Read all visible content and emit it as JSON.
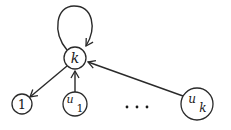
{
  "diagram": {
    "type": "directed-graph",
    "nodes": {
      "k": {
        "label": "k",
        "cx": 75,
        "cy": 58,
        "r": 11
      },
      "one": {
        "label": "1",
        "cx": 22,
        "cy": 104,
        "r": 10
      },
      "u1": {
        "label_main": "u",
        "label_sub": "1",
        "cx": 75,
        "cy": 104,
        "r": 12
      },
      "uk": {
        "label_main": "u",
        "label_sub": "k",
        "cx": 197,
        "cy": 104,
        "r": 16
      }
    },
    "ellipsis": "· · ·",
    "edges": [
      {
        "from": "k",
        "to": "k",
        "kind": "self-loop"
      },
      {
        "from": "k",
        "to": "1"
      },
      {
        "from": "u1",
        "to": "k"
      },
      {
        "from": "uk",
        "to": "k"
      }
    ],
    "colors": {
      "stroke": "#2a2a2a",
      "background": "#ffffff"
    }
  }
}
